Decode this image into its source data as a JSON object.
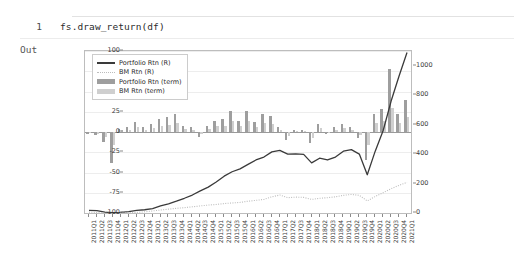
{
  "notebook": {
    "cell": {
      "line_number": "1",
      "code": "fs.draw_return(df)"
    },
    "output_label": "Out"
  },
  "chart_data": {
    "type": "bar",
    "title": "",
    "xlabel": "",
    "ylabel": "",
    "grid": true,
    "legend_position": "upper left",
    "left_axis": {
      "label": "",
      "ylim": [
        -100,
        100
      ],
      "ticks": [
        100,
        75,
        50,
        25,
        0,
        -25,
        -50,
        -75,
        -100
      ],
      "tick_labels": [
        "100",
        "75",
        "50",
        "25",
        "0",
        "-25",
        "-50",
        "-75",
        "-100"
      ]
    },
    "right_axis": {
      "label": "",
      "ylim": [
        0,
        1100
      ],
      "ticks": [
        0,
        200,
        400,
        600,
        800,
        1000
      ],
      "tick_labels": [
        "0",
        "200",
        "400",
        "600",
        "800",
        "1000"
      ]
    },
    "categories": [
      "2011Q1",
      "2011Q2",
      "2011Q3",
      "2011Q4",
      "2012Q1",
      "2012Q2",
      "2012Q3",
      "2012Q4",
      "2013Q1",
      "2013Q2",
      "2013Q3",
      "2013Q4",
      "2014Q1",
      "2014Q2",
      "2014Q3",
      "2014Q4",
      "2015Q1",
      "2015Q2",
      "2015Q3",
      "2015Q4",
      "2016Q1",
      "2016Q2",
      "2016Q3",
      "2016Q4",
      "2017Q1",
      "2017Q2",
      "2017Q3",
      "2017Q4",
      "2018Q1",
      "2018Q2",
      "2018Q3",
      "2018Q4",
      "2019Q1",
      "2019Q2",
      "2019Q3",
      "2019Q4",
      "2020Q1",
      "2020Q2",
      "2020Q3",
      "2020Q4",
      "2021Q1"
    ],
    "series": [
      {
        "name": "Portfolio Rtn (R)",
        "type": "line",
        "axis": "right",
        "style": "solid",
        "color": "#3a3a3a",
        "values": [
          18,
          16,
          6,
          2,
          4,
          10,
          18,
          22,
          30,
          48,
          62,
          80,
          100,
          122,
          150,
          176,
          210,
          250,
          280,
          300,
          330,
          360,
          380,
          415,
          425,
          400,
          402,
          398,
          340,
          372,
          360,
          380,
          420,
          430,
          400,
          260,
          420,
          560,
          760,
          930,
          1090
        ]
      },
      {
        "name": "BM Rtn (R)",
        "type": "line",
        "axis": "right",
        "style": "dotted",
        "color": "#bcbcbc",
        "values": [
          6,
          4,
          -2,
          -4,
          -2,
          2,
          4,
          8,
          14,
          20,
          26,
          32,
          36,
          42,
          48,
          54,
          58,
          64,
          68,
          72,
          80,
          86,
          92,
          110,
          122,
          104,
          108,
          106,
          92,
          100,
          104,
          110,
          120,
          126,
          120,
          82,
          112,
          138,
          165,
          188,
          208
        ]
      },
      {
        "name": "Portfolio Rtn (term)",
        "type": "bar",
        "axis": "left",
        "color": "#9e9e9e",
        "values": [
          -2,
          -4,
          -12,
          -38,
          4,
          6,
          12,
          6,
          10,
          16,
          18,
          22,
          8,
          6,
          -6,
          8,
          14,
          16,
          26,
          14,
          26,
          12,
          22,
          20,
          6,
          -10,
          2,
          2,
          -14,
          10,
          -2,
          6,
          10,
          6,
          -8,
          -34,
          22,
          28,
          78,
          22,
          40
        ]
      },
      {
        "name": "BM Rtn (term)",
        "type": "bar",
        "axis": "left",
        "color": "#cfcfcf",
        "values": [
          -1,
          -2,
          -6,
          -16,
          2,
          3,
          6,
          3,
          5,
          8,
          9,
          11,
          4,
          3,
          -3,
          4,
          7,
          8,
          13,
          7,
          13,
          6,
          11,
          10,
          3,
          -5,
          1,
          1,
          -7,
          5,
          -1,
          3,
          5,
          3,
          -4,
          -16,
          11,
          14,
          30,
          11,
          18
        ]
      }
    ],
    "legend": [
      {
        "label": "Portfolio Rtn (R)",
        "marker": "line-solid",
        "color": "#3a3a3a"
      },
      {
        "label": "BM Rtn (R)",
        "marker": "line-dotted",
        "color": "#bcbcbc"
      },
      {
        "label": "Portfolio Rtn (term)",
        "marker": "bar-swatch",
        "color": "#9e9e9e"
      },
      {
        "label": "BM Rtn (term)",
        "marker": "bar-swatch",
        "color": "#cfcfcf"
      }
    ]
  }
}
